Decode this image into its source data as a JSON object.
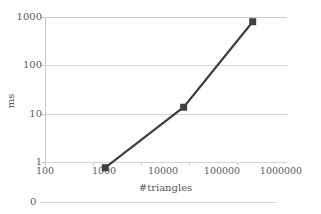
{
  "chart_data": {
    "type": "line",
    "title": "",
    "xlabel": "#triangles",
    "ylabel": "ms",
    "xscale": "log",
    "yscale": "log",
    "xlim": [
      100,
      1000000
    ],
    "ylim": [
      1,
      1000
    ],
    "grid": "horizontal",
    "legend": "none",
    "marker": "square",
    "series_color": "#3f3f3f",
    "grid_color": "#d4d4d4",
    "axis_color": "#c9c9c9",
    "text_color": "#595959",
    "x": [
      1000,
      20000,
      280000
    ],
    "y": [
      0.8,
      14,
      800
    ],
    "series": [
      {
        "name": "",
        "points": [
          {
            "x": 1000,
            "y": 0.8
          },
          {
            "x": 20000,
            "y": 14
          },
          {
            "x": 280000,
            "y": 800
          }
        ]
      }
    ],
    "x_ticks": [
      "100",
      "1000",
      "10000",
      "100000",
      "1000000"
    ],
    "x_tick_values": [
      100,
      1000,
      10000,
      100000,
      1000000
    ],
    "y_ticks": [
      "1",
      "10",
      "100",
      "1000"
    ],
    "y_tick_values": [
      1,
      10,
      100,
      1000
    ],
    "secondary_axis_label": "0"
  }
}
